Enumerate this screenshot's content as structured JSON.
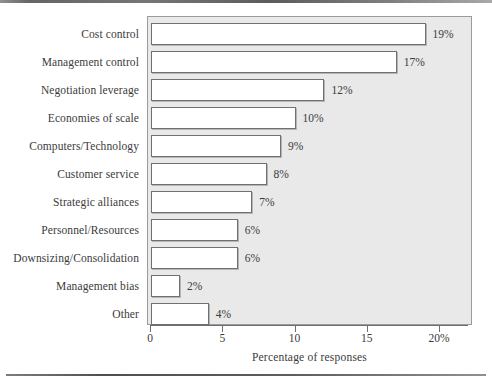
{
  "chart_data": {
    "type": "bar",
    "orientation": "horizontal",
    "title": "",
    "xlabel": "Percentage of responses",
    "ylabel": "",
    "categories": [
      "Cost control",
      "Management control",
      "Negotiation leverage",
      "Economies of scale",
      "Computers/Technology",
      "Customer service",
      "Strategic alliances",
      "Personnel/Resources",
      "Downsizing/Consolidation",
      "Management bias",
      "Other"
    ],
    "values": [
      19,
      17,
      12,
      10,
      9,
      8,
      7,
      6,
      6,
      2,
      4
    ],
    "value_labels": [
      "19%",
      "17%",
      "12%",
      "10%",
      "9%",
      "8%",
      "7%",
      "6%",
      "6%",
      "2%",
      "4%"
    ],
    "xlim": [
      0,
      22
    ],
    "xticks": [
      0,
      5,
      10,
      15,
      20
    ],
    "xtick_labels": [
      "0",
      "5",
      "10",
      "15",
      "20%"
    ],
    "grid": false,
    "legend": null,
    "bar_fill_color": "#ffffff",
    "bar_edge_color": "#70706e",
    "plot_background_color": "#e9e9e9",
    "page_background_color": "#ffffff",
    "text_color": "#3b3b3b"
  },
  "artifacts": {
    "top_rule": "",
    "bottom_rule": "",
    "ghost_text": [
      "",
      "",
      "",
      "",
      "",
      ""
    ]
  }
}
